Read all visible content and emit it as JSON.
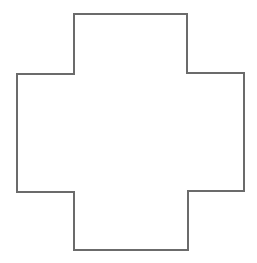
{
  "diagram": {
    "shape": "cross",
    "stroke_color": "#6b6b6b",
    "fill_color": "#ffffff",
    "background_color": "#ffffff",
    "stroke_width": 2,
    "vertices": [
      [
        74,
        14
      ],
      [
        187,
        14
      ],
      [
        187,
        73
      ],
      [
        244,
        73
      ],
      [
        244,
        191
      ],
      [
        188,
        191
      ],
      [
        188,
        250
      ],
      [
        74,
        250
      ],
      [
        74,
        192
      ],
      [
        17,
        192
      ],
      [
        17,
        74
      ],
      [
        74,
        74
      ]
    ]
  }
}
